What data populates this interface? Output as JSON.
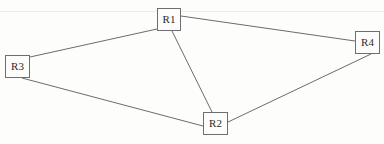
{
  "diagram": {
    "type": "node-link-graph",
    "background_color": "#fdfdfc",
    "node_border_color": "#6f6f73",
    "edge_color": "#5a5a5f",
    "label_color": "#2b2b2b",
    "nodes": [
      {
        "id": "R1",
        "label": "R1",
        "x": 157,
        "y": 8,
        "w": 24,
        "h": 23
      },
      {
        "id": "R2",
        "label": "R2",
        "x": 203,
        "y": 112,
        "w": 25,
        "h": 23
      },
      {
        "id": "R3",
        "label": "R3",
        "x": 5,
        "y": 55,
        "w": 25,
        "h": 23
      },
      {
        "id": "R4",
        "label": "R4",
        "x": 355,
        "y": 31,
        "w": 25,
        "h": 23
      }
    ],
    "edges": [
      {
        "id": "edge-r3-r1",
        "from": "R3",
        "to": "R1",
        "x1": 30,
        "y1": 57,
        "x2": 157,
        "y2": 29
      },
      {
        "id": "edge-r1-r4",
        "from": "R1",
        "to": "R4",
        "x1": 181,
        "y1": 16,
        "x2": 355,
        "y2": 41
      },
      {
        "id": "edge-r1-r2",
        "from": "R1",
        "to": "R2",
        "x1": 172,
        "y1": 31,
        "x2": 212,
        "y2": 112
      },
      {
        "id": "edge-r3-r2",
        "from": "R3",
        "to": "R2",
        "x1": 22,
        "y1": 78,
        "x2": 203,
        "y2": 126
      },
      {
        "id": "edge-r2-r4",
        "from": "R2",
        "to": "R4",
        "x1": 228,
        "y1": 122,
        "x2": 371,
        "y2": 54
      }
    ],
    "artifacts": [
      {
        "id": "scan-line-top",
        "y": 11
      }
    ]
  }
}
